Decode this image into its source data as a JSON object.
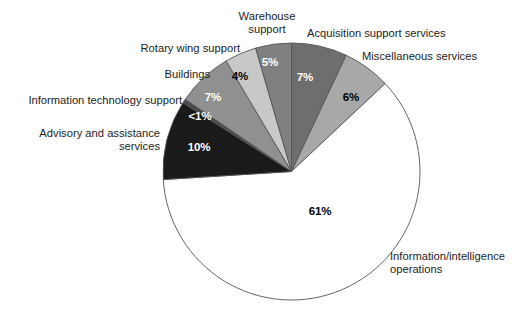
{
  "chart_data": {
    "type": "pie",
    "title": "",
    "subtitle": "",
    "xlabel": "",
    "ylabel": "",
    "legend_position": "none",
    "grid": false,
    "units": "percent",
    "total": 100,
    "start_angle_deg": 0,
    "direction": "clockwise",
    "categories": [
      "Acquisition support services",
      "Miscellaneous services",
      "Information/intelligence operations",
      "Advisory and assistance services",
      "Information technology support",
      "Buildings",
      "Rotary wing support",
      "Warehouse support"
    ],
    "values": [
      7,
      6,
      61,
      10,
      0.5,
      7,
      4,
      5
    ],
    "value_labels": [
      "7%",
      "6%",
      "61%",
      "10%",
      "<1%",
      "7%",
      "4%",
      "5%"
    ],
    "colors": [
      "#6e6e6e",
      "#a8a8a8",
      "#ffffff",
      "#1a1a1a",
      "#4a4a4a",
      "#909090",
      "#c8c8c8",
      "#808080"
    ],
    "slices": [
      {
        "label": "Acquisition support services",
        "value": 7,
        "value_label": "7%",
        "color": "#6e6e6e",
        "label_text_color": "#ffffff",
        "start_deg": 0,
        "end_deg": 25.2
      },
      {
        "label": "Miscellaneous services",
        "value": 6,
        "value_label": "6%",
        "color": "#a8a8a8",
        "label_text_color": "#000000",
        "start_deg": 25.2,
        "end_deg": 46.8
      },
      {
        "label": "Information/intelligence operations",
        "value": 61,
        "value_label": "61%",
        "color": "#ffffff",
        "label_text_color": "#000000",
        "start_deg": 46.8,
        "end_deg": 266.4
      },
      {
        "label": "Advisory and assistance services",
        "value": 10,
        "value_label": "10%",
        "color": "#1a1a1a",
        "label_text_color": "#ffffff",
        "start_deg": 266.4,
        "end_deg": 302.4
      },
      {
        "label": "Information technology support",
        "value": 0.5,
        "value_label": "<1%",
        "color": "#4a4a4a",
        "label_text_color": "#ffffff",
        "start_deg": 302.4,
        "end_deg": 304.2
      },
      {
        "label": "Buildings",
        "value": 7,
        "value_label": "7%",
        "color": "#909090",
        "label_text_color": "#ffffff",
        "start_deg": 304.2,
        "end_deg": 329.4
      },
      {
        "label": "Rotary wing support",
        "value": 4,
        "value_label": "4%",
        "color": "#c8c8c8",
        "label_text_color": "#000000",
        "start_deg": 329.4,
        "end_deg": 343.8
      },
      {
        "label": "Warehouse support",
        "value": 5,
        "value_label": "5%",
        "color": "#808080",
        "label_text_color": "#ffffff",
        "start_deg": 343.8,
        "end_deg": 360
      }
    ]
  },
  "labels": {
    "warehouse_support": "Warehouse\nsupport",
    "acquisition_support_services": "Acquisition support services",
    "miscellaneous_services": "Miscellaneous services",
    "rotary_wing_support": "Rotary wing support",
    "buildings": "Buildings",
    "information_technology_support": "Information technology support",
    "advisory_and_assistance_services": "Advisory and assistance\nservices",
    "information_intelligence_operations": "Information/intelligence\noperations"
  },
  "values": {
    "acquisition_support_services": "7%",
    "miscellaneous_services": "6%",
    "information_intelligence_operations": "61%",
    "advisory_and_assistance_services": "10%",
    "information_technology_support": "<1%",
    "buildings": "7%",
    "rotary_wing_support": "4%",
    "warehouse_support": "5%"
  },
  "style": {
    "outline_color": "#555555",
    "background": "#ffffff"
  }
}
